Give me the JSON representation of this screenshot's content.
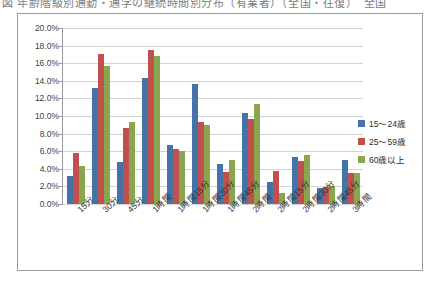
{
  "caption": {
    "text": "図 年齢階級別通勤・通学の継続時間別分布（有業者）（全国・往復）　全国"
  },
  "legend": {
    "position": "right",
    "items": [
      {
        "label": "15〜24歳",
        "color": "#4572a7"
      },
      {
        "label": "25〜59歳",
        "color": "#c0504d"
      },
      {
        "label": "60歳以上",
        "color": "#89a54e"
      }
    ]
  },
  "axis": {
    "y_ticks": [
      "0.0%",
      "2.0%",
      "4.0%",
      "6.0%",
      "8.0%",
      "10.0%",
      "12.0%",
      "14.0%",
      "16.0%",
      "18.0%",
      "20.0%"
    ]
  },
  "chart_data": {
    "type": "bar",
    "title": "",
    "xlabel": "",
    "ylabel": "",
    "ylim": [
      0,
      20
    ],
    "ytick_step": 2,
    "ytick_format": "percent",
    "grid": true,
    "legend_position": "right",
    "categories": [
      "15分",
      "30分",
      "45分",
      "1時間",
      "1時間15分",
      "1時間30分",
      "1時間45分",
      "2時間",
      "2時間15分",
      "2時間30分",
      "2時間45分",
      "3時間"
    ],
    "series": [
      {
        "name": "15〜24歳",
        "color": "#4572a7",
        "values": [
          3.2,
          13.2,
          4.8,
          14.3,
          6.7,
          13.6,
          4.6,
          10.3,
          2.5,
          5.3,
          1.8,
          5.0
        ]
      },
      {
        "name": "25〜59歳",
        "color": "#c0504d",
        "values": [
          5.8,
          17.0,
          8.6,
          17.5,
          6.2,
          9.3,
          3.6,
          9.7,
          3.7,
          4.9,
          1.9,
          3.5
        ]
      },
      {
        "name": "60歳以上",
        "color": "#89a54e",
        "values": [
          4.3,
          15.7,
          9.3,
          16.8,
          6.0,
          9.0,
          5.0,
          11.4,
          1.2,
          5.6,
          2.0,
          3.5
        ]
      }
    ]
  }
}
